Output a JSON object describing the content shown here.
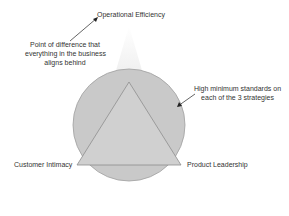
{
  "diagram": {
    "top_label": "Operational Efficiency",
    "left_label": "Customer Intimacy",
    "right_label": "Product Leadership",
    "annotation_left": [
      "Point of difference that",
      "everything in the business",
      "aligns behind"
    ],
    "annotation_right": [
      "High minimum standards on",
      "each of the 3 strategies"
    ]
  },
  "colors": {
    "circle_fill": "#c8c8c8",
    "triangle_fill": "#cfcfcf",
    "stroke": "#909090",
    "cone": "#f2f2f2"
  }
}
